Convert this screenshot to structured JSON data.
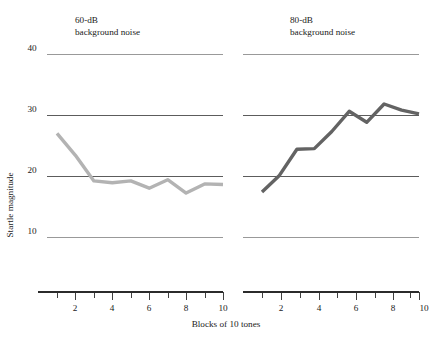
{
  "chart_data": {
    "type": "line",
    "title": "",
    "xlabel": "Blocks of 10 tones",
    "ylabel": "Startle magnitude",
    "grid": true,
    "legend": "none",
    "xlim": [
      1,
      10
    ],
    "ylim": [
      5,
      43
    ],
    "y_ticks": [
      40,
      30,
      20,
      10
    ],
    "x_ticks": [
      1,
      2,
      3,
      4,
      5,
      6,
      7,
      8,
      9,
      10
    ],
    "x_tick_labels": [
      "",
      "2",
      "",
      "4",
      "",
      "6",
      "",
      "8",
      "",
      "10"
    ],
    "panels": [
      {
        "id": "panel-60db",
        "title_line1": "60-dB",
        "title_line2": "background noise",
        "color": "#b3b3b3",
        "x": [
          1,
          2,
          3,
          4,
          5,
          6,
          7,
          8,
          9,
          10
        ],
        "values": [
          27.0,
          23.4,
          19.2,
          18.9,
          19.2,
          18.0,
          19.4,
          17.2,
          18.7,
          18.6
        ]
      },
      {
        "id": "panel-80db",
        "title_line1": "80-dB",
        "title_line2": "background noise",
        "color": "#636363",
        "x": [
          1,
          2,
          3,
          4,
          5,
          6,
          7,
          8,
          9,
          10
        ],
        "values": [
          17.4,
          20.1,
          24.4,
          24.5,
          27.3,
          30.6,
          28.8,
          31.8,
          30.8,
          30.2
        ]
      }
    ]
  },
  "axes": {
    "y_label": "Startle magnitude",
    "x_label": "Blocks of 10 tones",
    "y_tick_40": "40",
    "y_tick_30": "30",
    "y_tick_20": "20",
    "y_tick_10": "10"
  },
  "panel_left": {
    "title_line1": "60-dB",
    "title_line2": "background noise",
    "x_tick_2": "2",
    "x_tick_4": "4",
    "x_tick_6": "6",
    "x_tick_8": "8",
    "x_tick_10": "10"
  },
  "panel_right": {
    "title_line1": "80-dB",
    "title_line2": "background noise",
    "x_tick_2": "2",
    "x_tick_4": "4",
    "x_tick_6": "6",
    "x_tick_8": "8",
    "x_tick_10": "10"
  },
  "colors": {
    "series_60db": "#b3b3b3",
    "series_80db": "#636363",
    "gridline": "#4a4a4a",
    "axis": "#2b2b2b",
    "text": "#1a1a1a",
    "background": "#ffffff"
  }
}
